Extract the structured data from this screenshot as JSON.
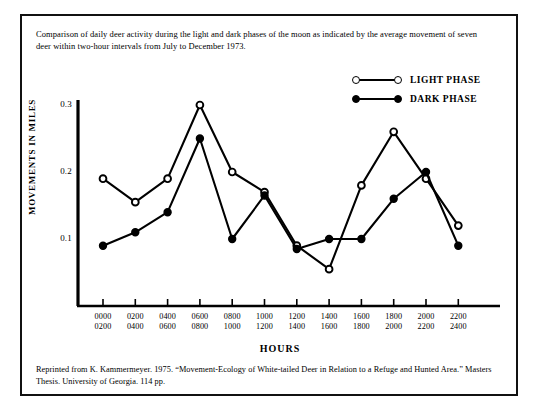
{
  "figure": {
    "caption_top": "Comparison of daily deer activity during the light and dark phases of the moon as indicated by the average movement of seven deer within two-hour intervals from July to December 1973.",
    "caption_bottom": "Reprinted from K. Kammermeyer. 1975. “Movement-Ecology of White-tailed Deer in Relation to a Refuge and Hunted Area.” Masters Thesis. University of Georgia. 114 pp.",
    "frame_color": "#111111",
    "ink_color": "#000000",
    "background": "#ffffff"
  },
  "legend": {
    "position": "top-right",
    "entries": [
      {
        "label": "LIGHT PHASE",
        "marker": "open-circle",
        "marker_fill": "#ffffff",
        "line_color": "#000000"
      },
      {
        "label": "DARK PHASE",
        "marker": "filled-circle",
        "marker_fill": "#000000",
        "line_color": "#000000"
      }
    ]
  },
  "chart_data": {
    "type": "line",
    "title": "",
    "subtitle": "",
    "xlabel": "HOURS",
    "ylabel": "MOVEMENTS IN MILES",
    "categories": [
      "0000\n0200",
      "0200\n0400",
      "0400\n0600",
      "0600\n0800",
      "0800\n1000",
      "1000\n1200",
      "1200\n1400",
      "1400\n1600",
      "1600\n1800",
      "1800\n2000",
      "2000\n2200",
      "2200\n2400"
    ],
    "category_lines": [
      [
        "0000",
        "0200"
      ],
      [
        "0200",
        "0400"
      ],
      [
        "0400",
        "0600"
      ],
      [
        "0600",
        "0800"
      ],
      [
        "0800",
        "1000"
      ],
      [
        "1000",
        "1200"
      ],
      [
        "1200",
        "1400"
      ],
      [
        "1400",
        "1600"
      ],
      [
        "1600",
        "1800"
      ],
      [
        "1800",
        "2000"
      ],
      [
        "2000",
        "2200"
      ],
      [
        "2200",
        "2400"
      ]
    ],
    "ylim": [
      0.0,
      0.3
    ],
    "yticks": [
      0.1,
      0.2,
      0.3
    ],
    "ytick_labels": [
      "0.1",
      "0.2",
      "0.3"
    ],
    "grid": false,
    "legend_position": "top-right",
    "series": [
      {
        "name": "LIGHT PHASE",
        "marker": "open-circle",
        "values": [
          0.19,
          0.155,
          0.19,
          0.3,
          0.2,
          0.17,
          0.09,
          0.055,
          0.18,
          0.26,
          0.19,
          0.12
        ]
      },
      {
        "name": "DARK PHASE",
        "marker": "filled-circle",
        "values": [
          0.09,
          0.11,
          0.14,
          0.25,
          0.1,
          0.165,
          0.085,
          0.1,
          0.1,
          0.16,
          0.2,
          0.09
        ]
      }
    ]
  },
  "axes": {
    "y_tick_text": [
      "0.3",
      "0.2",
      "0.1"
    ],
    "x_title": "HOURS",
    "y_title": "MOVEMENTS IN MILES"
  }
}
